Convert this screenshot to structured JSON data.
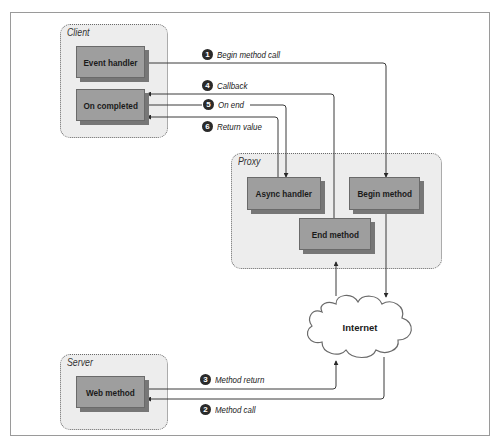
{
  "diagram": {
    "regions": {
      "client": {
        "label": "Client"
      },
      "proxy": {
        "label": "Proxy"
      },
      "server": {
        "label": "Server"
      }
    },
    "nodes": {
      "event_handler": "Event handler",
      "on_completed": "On completed",
      "async_handler": "Async handler",
      "begin_method": "Begin method",
      "end_method": "End method",
      "web_method": "Web method",
      "internet": "Internet"
    },
    "steps": [
      {
        "num": "1",
        "label": "Begin method call"
      },
      {
        "num": "2",
        "label": "Method call"
      },
      {
        "num": "3",
        "label": "Method return"
      },
      {
        "num": "4",
        "label": "Callback"
      },
      {
        "num": "5",
        "label": "On end"
      },
      {
        "num": "6",
        "label": "Return value"
      }
    ],
    "colors": {
      "node_fill": "#9e9e9e",
      "region_fill": "#ededed",
      "line": "#3a3a3a",
      "step_badge": "#2a2a2a"
    }
  }
}
